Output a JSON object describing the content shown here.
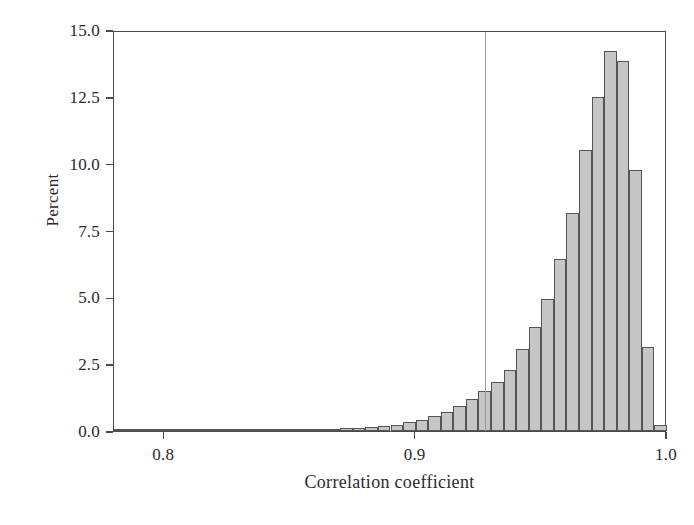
{
  "chart_data": {
    "type": "bar",
    "title": "",
    "xlabel": "Correlation coefficient",
    "ylabel": "Percent",
    "xlim": [
      0.78,
      1.0
    ],
    "ylim": [
      0.0,
      15.0
    ],
    "grid": false,
    "legend": null,
    "bin_width": 0.005,
    "xtick_labels": [
      "0.8",
      "0.9",
      "1.0"
    ],
    "xtick_values": [
      0.8,
      0.9,
      1.0
    ],
    "ytick_labels": [
      "0.0",
      "2.5",
      "5.0",
      "7.5",
      "10.0",
      "12.5",
      "15.0"
    ],
    "ytick_values": [
      0.0,
      2.5,
      5.0,
      7.5,
      10.0,
      12.5,
      15.0
    ],
    "annotations": [
      {
        "name": "reference-line",
        "type": "vline",
        "x": 0.9275,
        "color": "#9a9a9a"
      }
    ],
    "bar_fill_color": "#c6c6c6",
    "bar_edge_color": "#555555",
    "categories": [
      0.78,
      0.785,
      0.79,
      0.795,
      0.8,
      0.805,
      0.81,
      0.815,
      0.82,
      0.825,
      0.83,
      0.835,
      0.84,
      0.845,
      0.85,
      0.855,
      0.86,
      0.865,
      0.87,
      0.875,
      0.88,
      0.885,
      0.89,
      0.895,
      0.9,
      0.905,
      0.91,
      0.915,
      0.92,
      0.925,
      0.93,
      0.935,
      0.94,
      0.945,
      0.95,
      0.955,
      0.96,
      0.965,
      0.97,
      0.975,
      0.98,
      0.985,
      0.99,
      0.995
    ],
    "values": [
      0.0,
      0.0,
      0.0,
      0.02,
      0.02,
      0.02,
      0.03,
      0.03,
      0.04,
      0.04,
      0.05,
      0.05,
      0.06,
      0.06,
      0.07,
      0.08,
      0.08,
      0.09,
      0.1,
      0.12,
      0.14,
      0.18,
      0.24,
      0.32,
      0.42,
      0.55,
      0.72,
      0.95,
      1.2,
      1.5,
      1.85,
      2.3,
      3.05,
      3.9,
      4.95,
      6.45,
      8.15,
      10.5,
      12.5,
      14.2,
      13.85,
      9.75,
      3.15,
      0.22
    ]
  }
}
